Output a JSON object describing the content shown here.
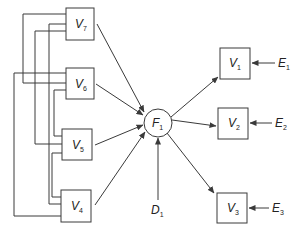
{
  "diagram": {
    "type": "path-diagram",
    "observed_variables": [
      {
        "id": "V7",
        "main": "V",
        "sub": "7"
      },
      {
        "id": "V6",
        "main": "V",
        "sub": "6"
      },
      {
        "id": "V5",
        "main": "V",
        "sub": "5"
      },
      {
        "id": "V4",
        "main": "V",
        "sub": "4"
      },
      {
        "id": "V1",
        "main": "V",
        "sub": "1"
      },
      {
        "id": "V2",
        "main": "V",
        "sub": "2"
      },
      {
        "id": "V3",
        "main": "V",
        "sub": "3"
      }
    ],
    "factor": {
      "id": "F1",
      "main": "F",
      "sub": "1"
    },
    "disturbance": {
      "id": "D1",
      "main": "D",
      "sub": "1"
    },
    "errors": [
      {
        "id": "E1",
        "main": "E",
        "sub": "1"
      },
      {
        "id": "E2",
        "main": "E",
        "sub": "2"
      },
      {
        "id": "E3",
        "main": "E",
        "sub": "3"
      }
    ],
    "edges": [
      {
        "from": "V7",
        "to": "F1",
        "kind": "arrow"
      },
      {
        "from": "V6",
        "to": "F1",
        "kind": "arrow"
      },
      {
        "from": "V5",
        "to": "F1",
        "kind": "arrow"
      },
      {
        "from": "V4",
        "to": "F1",
        "kind": "arrow"
      },
      {
        "from": "F1",
        "to": "V1",
        "kind": "arrow"
      },
      {
        "from": "F1",
        "to": "V2",
        "kind": "arrow"
      },
      {
        "from": "F1",
        "to": "V3",
        "kind": "arrow"
      },
      {
        "from": "D1",
        "to": "F1",
        "kind": "arrow"
      },
      {
        "from": "E1",
        "to": "V1",
        "kind": "arrow"
      },
      {
        "from": "E2",
        "to": "V2",
        "kind": "arrow"
      },
      {
        "from": "E3",
        "to": "V3",
        "kind": "arrow"
      },
      {
        "from": "V7",
        "to": "V6",
        "kind": "covariance-line"
      },
      {
        "from": "V7",
        "to": "V5",
        "kind": "covariance-line"
      },
      {
        "from": "V7",
        "to": "V4",
        "kind": "covariance-line"
      },
      {
        "from": "V6",
        "to": "V5",
        "kind": "covariance-line"
      },
      {
        "from": "V6",
        "to": "V4",
        "kind": "covariance-line"
      },
      {
        "from": "V5",
        "to": "V4",
        "kind": "covariance-line"
      }
    ]
  },
  "labels": {
    "V7": {
      "main": "V",
      "sub": "7"
    },
    "V6": {
      "main": "V",
      "sub": "6"
    },
    "V5": {
      "main": "V",
      "sub": "5"
    },
    "V4": {
      "main": "V",
      "sub": "4"
    },
    "V1": {
      "main": "V",
      "sub": "1"
    },
    "V2": {
      "main": "V",
      "sub": "2"
    },
    "V3": {
      "main": "V",
      "sub": "3"
    },
    "F1": {
      "main": "F",
      "sub": "1"
    },
    "D1": {
      "main": "D",
      "sub": "1"
    },
    "E1": {
      "main": "E",
      "sub": "1"
    },
    "E2": {
      "main": "E",
      "sub": "2"
    },
    "E3": {
      "main": "E",
      "sub": "3"
    }
  },
  "colors": {
    "line": "#3a3a3a",
    "background": "#ffffff",
    "text": "#222222"
  }
}
